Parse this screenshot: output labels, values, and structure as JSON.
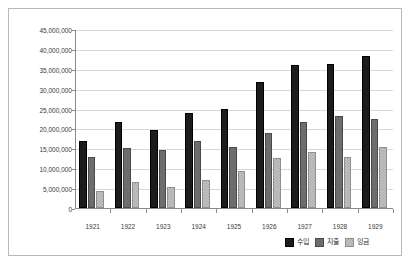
{
  "chart_data": {
    "type": "bar",
    "title": "",
    "xlabel": "",
    "ylabel": "",
    "categories": [
      "1921",
      "1922",
      "1923",
      "1924",
      "1925",
      "1926",
      "1927",
      "1928",
      "1929"
    ],
    "series": [
      {
        "name": "수입",
        "color": "#1c1c1c",
        "values": [
          16900000,
          21500000,
          19500000,
          23900000,
          24800000,
          31600000,
          35900000,
          36300000,
          38100000
        ]
      },
      {
        "name": "지출",
        "color": "#6d6d6d",
        "values": [
          12700000,
          15000000,
          14600000,
          16800000,
          15300000,
          18800000,
          21700000,
          23200000,
          22400000
        ]
      },
      {
        "name": "잉금",
        "color": "#c4c4c4",
        "values": [
          4300000,
          6500000,
          5200000,
          7000000,
          9300000,
          12500000,
          14200000,
          12800000,
          15300000
        ]
      }
    ],
    "ylim": [
      0,
      45000000
    ],
    "ytick_step": 5000000,
    "ytick_labels": [
      "45,000,000",
      "40,000,000",
      "35,000,000",
      "30,000,000",
      "25,000,000",
      "20,000,000",
      "15,000,000",
      "10,000,000",
      "5,000,000",
      "0"
    ],
    "ytick_values": [
      45000000,
      40000000,
      35000000,
      30000000,
      25000000,
      20000000,
      15000000,
      10000000,
      5000000,
      0
    ],
    "grid": true,
    "legend_position": "bottom-right"
  },
  "legend": {
    "items": [
      {
        "label": "수입",
        "swatch": "series-0-swatch"
      },
      {
        "label": "지출",
        "swatch": "series-1-swatch"
      },
      {
        "label": "잉금",
        "swatch": "series-2-swatch"
      }
    ]
  }
}
